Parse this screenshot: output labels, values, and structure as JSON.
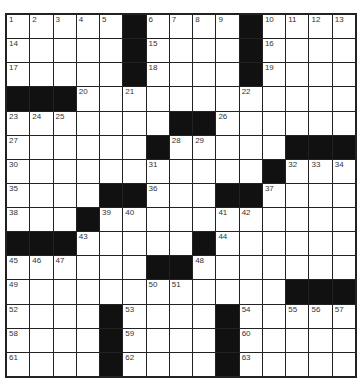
{
  "puzzle": {
    "rows": 15,
    "cols": 15,
    "layout": [
      ".....#....#....",
      ".....#....#....",
      ".....#....#....",
      "###............",
      ".......##......",
      "......#.....###",
      "...........#...",
      "....##...##....",
      "...#...........",
      "###.....#......",
      "......##.......",
      "............###",
      "....#....#.....",
      "....#....#.....",
      "....#....#....."
    ],
    "numbers": {
      "0,0": "1",
      "0,1": "2",
      "0,2": "3",
      "0,3": "4",
      "0,4": "5",
      "0,6": "6",
      "0,7": "7",
      "0,8": "8",
      "0,9": "9",
      "0,11": "10",
      "0,12": "11",
      "0,13": "12",
      "0,14": "13",
      "1,0": "14",
      "1,6": "15",
      "1,11": "16",
      "2,0": "17",
      "2,6": "18",
      "2,11": "19",
      "3,3": "20",
      "3,5": "21",
      "3,10": "22",
      "4,0": "23",
      "4,1": "24",
      "4,2": "25",
      "4,9": "26",
      "5,0": "27",
      "5,7": "28",
      "5,8": "29",
      "6,0": "30",
      "6,6": "31",
      "6,12": "32",
      "6,13": "33",
      "6,14": "34",
      "7,0": "35",
      "7,6": "36",
      "7,11": "37",
      "8,0": "38",
      "8,4": "39",
      "8,5": "40",
      "8,9": "41",
      "8,10": "42",
      "9,3": "43",
      "9,9": "44",
      "10,0": "45",
      "10,1": "46",
      "10,2": "47",
      "10,8": "48",
      "11,0": "49",
      "11,6": "50",
      "11,7": "51",
      "12,0": "52",
      "12,5": "53",
      "12,10": "54",
      "12,12": "55",
      "12,13": "56",
      "12,14": "57",
      "13,0": "58",
      "13,5": "59",
      "13,10": "60",
      "14,0": "61",
      "14,5": "62",
      "14,10": "63"
    },
    "colors": {
      "block": "#111111",
      "cell": "#ffffff",
      "line": "#222222",
      "number": "#333333"
    }
  }
}
